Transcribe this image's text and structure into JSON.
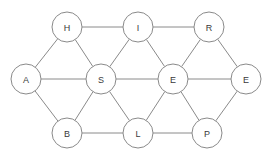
{
  "diagram": {
    "background_color": "#ffffff",
    "node_fill_color": "#ffffff",
    "node_stroke_color": "#8a8a8a",
    "edge_color": "#8a8a8a",
    "label_color": "#3a3a3a",
    "node_radius": 15,
    "nodes": [
      {
        "id": "H",
        "label": "H",
        "x": 67,
        "y": 27,
        "row": "top"
      },
      {
        "id": "I",
        "label": "I",
        "x": 138,
        "y": 27,
        "row": "top"
      },
      {
        "id": "R",
        "label": "R",
        "x": 209,
        "y": 27,
        "row": "top"
      },
      {
        "id": "A",
        "label": "A",
        "x": 26,
        "y": 79,
        "row": "middle"
      },
      {
        "id": "S",
        "label": "S",
        "x": 101,
        "y": 79,
        "row": "middle"
      },
      {
        "id": "E1",
        "label": "E",
        "x": 173,
        "y": 79,
        "row": "middle"
      },
      {
        "id": "E2",
        "label": "E",
        "x": 246,
        "y": 79,
        "row": "middle"
      },
      {
        "id": "B",
        "label": "B",
        "x": 67,
        "y": 133,
        "row": "bottom"
      },
      {
        "id": "L",
        "label": "L",
        "x": 138,
        "y": 133,
        "row": "bottom"
      },
      {
        "id": "P",
        "label": "P",
        "x": 207,
        "y": 133,
        "row": "bottom"
      }
    ],
    "edges": [
      {
        "from": "H",
        "to": "I"
      },
      {
        "from": "I",
        "to": "R"
      },
      {
        "from": "A",
        "to": "S"
      },
      {
        "from": "S",
        "to": "E1"
      },
      {
        "from": "E1",
        "to": "E2"
      },
      {
        "from": "B",
        "to": "L"
      },
      {
        "from": "L",
        "to": "P"
      },
      {
        "from": "A",
        "to": "H"
      },
      {
        "from": "H",
        "to": "S"
      },
      {
        "from": "S",
        "to": "I"
      },
      {
        "from": "I",
        "to": "E1"
      },
      {
        "from": "E1",
        "to": "R"
      },
      {
        "from": "R",
        "to": "E2"
      },
      {
        "from": "A",
        "to": "B"
      },
      {
        "from": "B",
        "to": "S"
      },
      {
        "from": "S",
        "to": "L"
      },
      {
        "from": "L",
        "to": "E1"
      },
      {
        "from": "E1",
        "to": "P"
      },
      {
        "from": "P",
        "to": "E2"
      }
    ]
  }
}
